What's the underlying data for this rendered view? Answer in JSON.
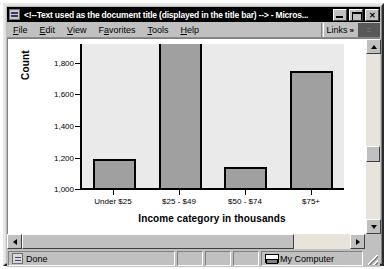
{
  "window": {
    "title": "<!--Text used as the document title (displayed in the title bar) --> - Micros...",
    "icon": "ie-document-icon",
    "minimize_label": "",
    "maximize_label": "",
    "close_label": "✕"
  },
  "menu": {
    "items": [
      {
        "label": "File",
        "accel": "F"
      },
      {
        "label": "Edit",
        "accel": "E"
      },
      {
        "label": "View",
        "accel": "V"
      },
      {
        "label": "Favorites",
        "accel": "a"
      },
      {
        "label": "Tools",
        "accel": "T"
      },
      {
        "label": "Help",
        "accel": "H"
      }
    ],
    "links_label": "Links",
    "links_chevron": "»"
  },
  "status": {
    "message": "Done",
    "zone": "My Computer",
    "panel_2": "",
    "panel_3": "",
    "panel_4": ""
  },
  "scrollbars": {
    "up_arrow": "up-arrow-icon",
    "down_arrow": "down-arrow-icon",
    "left_arrow": "left-arrow-icon",
    "right_arrow": "right-arrow-icon"
  },
  "colors": {
    "title_bar": "#000000",
    "window_face": "#c0c0c0",
    "plot_background": "#eaeaea",
    "bar_fill": "#a0a0a0",
    "bar_outline": "#000000"
  },
  "chart_data": {
    "type": "bar",
    "title": "",
    "categories": [
      "Under $25",
      "$25 - $49",
      "$50 - $74",
      "$75+"
    ],
    "values": [
      1180,
      1960,
      1130,
      1730
    ],
    "xlabel": "Income category in thousands",
    "ylabel": "Count",
    "ylim": [
      1000,
      1900
    ],
    "yticks": [
      1800,
      1600,
      1400,
      1200,
      1000
    ],
    "ytick_labels": [
      "1,800",
      "1,600",
      "1,400",
      "1,200",
      "1,000"
    ],
    "grid": false,
    "legend": false
  }
}
